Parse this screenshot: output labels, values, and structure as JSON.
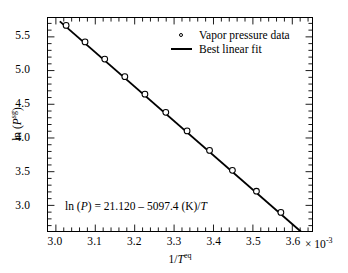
{
  "chart_data": {
    "type": "scatter",
    "title": "",
    "xlabel": "1/T eq",
    "ylabel": "ln (P sg)",
    "x_multiplier": "× 10",
    "x_multiplier_exp": "-3",
    "xlim": [
      2.98,
      3.65
    ],
    "ylim": [
      2.62,
      5.78
    ],
    "x_ticks": [
      "3.0",
      "3.1",
      "3.2",
      "3.3",
      "3.4",
      "3.5",
      "3.6"
    ],
    "x_tick_values": [
      3.0,
      3.1,
      3.2,
      3.3,
      3.4,
      3.5,
      3.6
    ],
    "y_ticks": [
      "3.0",
      "3.5",
      "4.0",
      "4.5",
      "5.0",
      "5.5"
    ],
    "y_tick_values": [
      3.0,
      3.5,
      4.0,
      4.5,
      5.0,
      5.5
    ],
    "minor_ticks_per_interval": 4,
    "grid": false,
    "legend_position": "upper right",
    "series": [
      {
        "name": "Vapor pressure data",
        "marker": "open-circle",
        "x": [
          3.026,
          3.074,
          3.124,
          3.175,
          3.226,
          3.279,
          3.333,
          3.39,
          3.448,
          3.509,
          3.571,
          3.636
        ],
        "y": [
          5.67,
          5.425,
          5.17,
          4.91,
          4.65,
          4.38,
          4.105,
          3.815,
          3.52,
          3.21,
          2.895,
          2.57
        ]
      },
      {
        "name": "Best linear fit",
        "marker": "line",
        "intercept": 21.12,
        "slope": -5097.4,
        "x": [
          3.01,
          3.645
        ],
        "y": [
          5.7303,
          2.4928
        ]
      }
    ],
    "annotation": "ln (P) = 21.120 – 5097.4 (K)/T",
    "annotation_parts": {
      "lead": "ln (",
      "p_symbol": "P",
      "mid": ") = 21.120 – 5097.4 (K)/",
      "t_symbol": "T"
    }
  },
  "legend": {
    "items": [
      {
        "label": "Vapor pressure data",
        "key": "open-circle"
      },
      {
        "label": "Best linear fit",
        "key": "solid-line"
      }
    ]
  },
  "axes": {
    "y_title_parts": {
      "lead": "ln (",
      "symbol": "P",
      "sup": "sg",
      "tail": ")"
    },
    "x_title_parts": {
      "lead": "1/",
      "symbol": "T",
      "sup": "eq"
    }
  },
  "colors": {
    "axis": "#000000",
    "line": "#000000",
    "marker_fill": "#ffffff",
    "marker_edge": "#000000",
    "background": "#ffffff"
  }
}
